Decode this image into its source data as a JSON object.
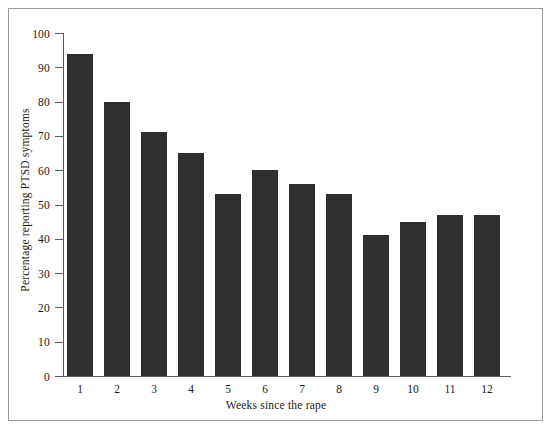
{
  "chart_data": {
    "type": "bar",
    "title": "",
    "xlabel": "Weeks since the rape",
    "ylabel": "Percentage reporting PTSD symptoms",
    "categories": [
      "1",
      "2",
      "3",
      "4",
      "5",
      "6",
      "7",
      "8",
      "9",
      "10",
      "11",
      "12"
    ],
    "values": [
      94,
      80,
      71,
      65,
      53,
      60,
      56,
      53,
      41,
      45,
      47,
      47
    ],
    "ylim": [
      0,
      100
    ],
    "yticks": [
      0,
      10,
      20,
      30,
      40,
      50,
      60,
      70,
      80,
      90,
      100
    ],
    "ytick_labels": [
      "0",
      "10",
      "20",
      "30",
      "40",
      "50",
      "60",
      "70",
      "80",
      "90",
      "100"
    ],
    "grid": false,
    "legend": null,
    "bar_color": "#2f2f2f",
    "axis_color": "#5a5a5a",
    "background_color": "#ffffff",
    "frame_color": "#9a9a9a"
  }
}
